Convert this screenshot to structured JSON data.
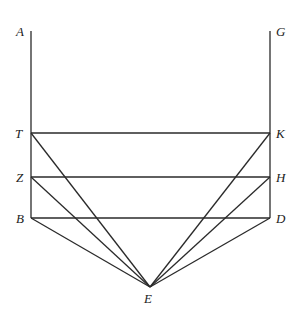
{
  "diagram": {
    "points": {
      "A": {
        "label": "A",
        "x": 31,
        "y": 31
      },
      "G": {
        "label": "G",
        "x": 270,
        "y": 31
      },
      "T": {
        "label": "T",
        "x": 31,
        "y": 133
      },
      "K": {
        "label": "K",
        "x": 270,
        "y": 133
      },
      "Z": {
        "label": "Z",
        "x": 31,
        "y": 177
      },
      "H": {
        "label": "H",
        "x": 270,
        "y": 177
      },
      "B": {
        "label": "B",
        "x": 31,
        "y": 218
      },
      "D": {
        "label": "D",
        "x": 270,
        "y": 218
      },
      "E": {
        "label": "E",
        "x": 150,
        "y": 287
      }
    },
    "segments": [
      [
        "A",
        "B"
      ],
      [
        "G",
        "D"
      ],
      [
        "T",
        "K"
      ],
      [
        "Z",
        "H"
      ],
      [
        "B",
        "D"
      ],
      [
        "T",
        "E"
      ],
      [
        "Z",
        "E"
      ],
      [
        "B",
        "E"
      ],
      [
        "K",
        "E"
      ],
      [
        "H",
        "E"
      ],
      [
        "D",
        "E"
      ]
    ]
  }
}
